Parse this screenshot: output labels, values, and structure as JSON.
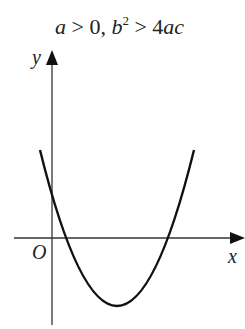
{
  "title": {
    "a": "a",
    "gt1": " > 0, ",
    "b": "b",
    "sup": "2",
    "gt2": " > 4",
    "ac": "ac"
  },
  "axes": {
    "x_label": "x",
    "y_label": "y",
    "origin_label": "O"
  },
  "colors": {
    "stroke": "#222222",
    "background": "#ffffff"
  },
  "curve": {
    "type": "parabola",
    "opens": "upward",
    "path": "M 40 150 Q 117 462 194 150"
  }
}
